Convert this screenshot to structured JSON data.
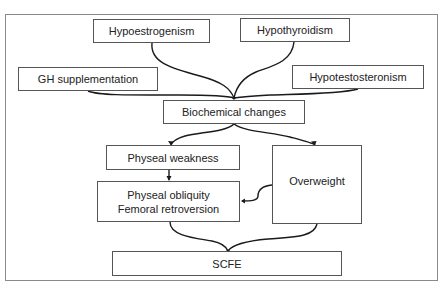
{
  "diagram": {
    "type": "flowchart",
    "nodes": {
      "hypoestrogenism": "Hypoestrogenism",
      "hypothyroidism": "Hypothyroidism",
      "gh_supplementation": "GH supplementation",
      "hypotestosteronism": "Hypotestosteronism",
      "biochemical_changes": "Biochemical changes",
      "physeal_weakness": "Physeal weakness",
      "physeal_obliquity": "Physeal obliquity",
      "femoral_retroversion": "Femoral retroversion",
      "overweight": "Overweight",
      "scfe": "SCFE"
    },
    "edges": [
      {
        "from": "Hypoestrogenism",
        "to": "Biochemical changes"
      },
      {
        "from": "Hypothyroidism",
        "to": "Biochemical changes"
      },
      {
        "from": "GH supplementation",
        "to": "Biochemical changes"
      },
      {
        "from": "Hypotestosteronism",
        "to": "Biochemical changes"
      },
      {
        "from": "Biochemical changes",
        "to": "Physeal weakness"
      },
      {
        "from": "Biochemical changes",
        "to": "Overweight"
      },
      {
        "from": "Physeal weakness",
        "to": "Physeal obliquity / Femoral retroversion"
      },
      {
        "from": "Overweight",
        "to": "Physeal obliquity / Femoral retroversion"
      },
      {
        "from": "Physeal obliquity / Femoral retroversion",
        "to": "SCFE"
      },
      {
        "from": "Overweight",
        "to": "SCFE"
      }
    ],
    "colors": {
      "line": "#1a1a1a",
      "box_border": "#555555",
      "frame_border": "#8a8a8a",
      "text": "#222222"
    }
  }
}
